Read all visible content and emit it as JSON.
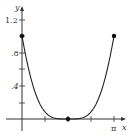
{
  "chart_data": {
    "type": "line",
    "title": "",
    "function": "(1 - sin x)^2",
    "xlabel": "x",
    "ylabel": "y",
    "xlim": [
      0,
      3.14159
    ],
    "ylim": [
      0,
      1.3
    ],
    "grid": false,
    "legend": null,
    "x_ticks": [
      0.7854,
      1.5708,
      2.3562,
      3.14159
    ],
    "x_tick_labels": [
      "",
      "",
      "",
      "π"
    ],
    "y_ticks": [
      0.2,
      0.4,
      0.6,
      0.8,
      1.0,
      1.2
    ],
    "y_tick_labels": [
      "",
      ".4",
      "",
      ".8",
      "",
      "1.2"
    ],
    "series": [
      {
        "name": "f(x)",
        "x": [
          0,
          0.1571,
          0.3142,
          0.4712,
          0.6283,
          0.7854,
          0.9425,
          1.0996,
          1.2566,
          1.4137,
          1.5708,
          1.7279,
          1.885,
          2.042,
          2.1991,
          2.3562,
          2.5133,
          2.6704,
          2.8274,
          2.9845,
          3.14159
        ],
        "values": [
          1.0,
          0.712,
          0.477,
          0.296,
          0.169,
          0.086,
          0.036,
          0.011,
          0.002,
          0.0002,
          0.0,
          0.0002,
          0.002,
          0.011,
          0.036,
          0.086,
          0.169,
          0.296,
          0.477,
          0.712,
          1.0
        ]
      }
    ],
    "highlighted_points": [
      {
        "x": 0,
        "y": 1
      },
      {
        "x": 1.5708,
        "y": 0
      },
      {
        "x": 3.14159,
        "y": 1
      }
    ]
  },
  "axes": {
    "x_label": "x",
    "y_label": "y",
    "pi_label": "π",
    "y_label_04": ".4",
    "y_label_08": ".8",
    "y_label_12": "1.2"
  },
  "colors": {
    "curve": "#222222",
    "axis": "#333333",
    "background": "#ffffff"
  }
}
